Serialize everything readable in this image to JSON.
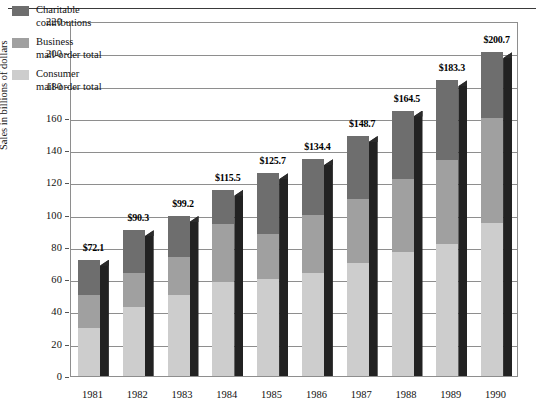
{
  "chart_data": {
    "type": "bar",
    "subtype": "stacked-column-3d",
    "title": "",
    "xlabel": "",
    "ylabel": "Sales in billions of dollars",
    "ylim": [
      0,
      220
    ],
    "ytick_step": 20,
    "yticks": [
      0,
      20,
      40,
      60,
      80,
      100,
      120,
      140,
      160,
      180,
      200,
      220
    ],
    "grid": true,
    "legend_position": "top-left-inside",
    "categories": [
      "1981",
      "1982",
      "1983",
      "1984",
      "1985",
      "1986",
      "1987",
      "1988",
      "1989",
      "1990"
    ],
    "series": [
      {
        "name": "Consumer mail-order total",
        "color": "#cdcdcd",
        "values": [
          30.0,
          43.0,
          50.0,
          58.0,
          60.0,
          64.0,
          70.0,
          77.0,
          82.0,
          95.0
        ]
      },
      {
        "name": "Business mail-order total",
        "color": "#a0a0a0",
        "values": [
          20.0,
          21.0,
          24.0,
          36.0,
          28.0,
          36.0,
          40.0,
          45.0,
          52.0,
          65.0
        ]
      },
      {
        "name": "Charitable contributions",
        "color": "#6e6e6e",
        "values": [
          22.1,
          26.3,
          25.2,
          21.5,
          37.7,
          34.4,
          38.7,
          42.5,
          49.3,
          40.7
        ]
      }
    ],
    "totals": [
      72.1,
      90.3,
      99.2,
      115.5,
      125.7,
      134.4,
      148.7,
      164.5,
      183.3,
      200.7
    ],
    "total_labels": [
      "$72.1",
      "$90.3",
      "$99.2",
      "$115.5",
      "$125.7",
      "$134.4",
      "$148.7",
      "$164.5",
      "$183.3",
      "$200.7"
    ]
  },
  "legend": {
    "items": [
      {
        "key": "charitable",
        "line1": "Charitable",
        "line2": "contributions",
        "color": "#6e6e6e"
      },
      {
        "key": "business",
        "line1": "Business",
        "line2": "mail-order total",
        "color": "#a0a0a0"
      },
      {
        "key": "consumer",
        "line1": "Consumer",
        "line2": "mail-order total",
        "color": "#cdcdcd"
      }
    ]
  },
  "axis": {
    "y_title": "Sales in billions of dollars"
  }
}
